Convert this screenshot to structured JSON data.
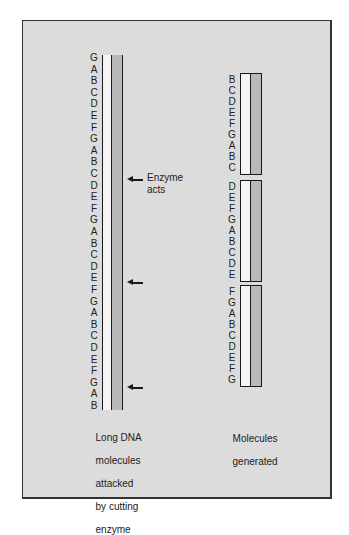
{
  "diagram": {
    "left": {
      "sequence": [
        "G",
        "A",
        "B",
        "C",
        "D",
        "E",
        "F",
        "G",
        "A",
        "B",
        "C",
        "D",
        "E",
        "F",
        "G",
        "A",
        "B",
        "C",
        "D",
        "E",
        "F",
        "G",
        "A",
        "B",
        "C",
        "D",
        "E",
        "F",
        "G",
        "A",
        "B"
      ],
      "enzyme_label_line1": "Enzyme",
      "enzyme_label_line2": "acts",
      "cut_positions_after_index": [
        10,
        19,
        28
      ],
      "caption_lines": [
        "Long DNA",
        "molecules",
        "attacked",
        "by cutting",
        "enzyme"
      ]
    },
    "right": {
      "fragments": [
        [
          "B",
          "C",
          "D",
          "E",
          "F",
          "G",
          "A",
          "B",
          "C"
        ],
        [
          "D",
          "E",
          "F",
          "G",
          "A",
          "B",
          "C",
          "D",
          "E"
        ],
        [
          "F",
          "G",
          "A",
          "B",
          "C",
          "D",
          "E",
          "F",
          "G"
        ]
      ],
      "caption_lines": [
        "Molecules",
        "generated"
      ]
    },
    "colors": {
      "background": "#dcdcdc",
      "strand_light": "#f4f4f4",
      "strand_dark": "#b9b9b9",
      "line": "#1a1a1a"
    }
  }
}
